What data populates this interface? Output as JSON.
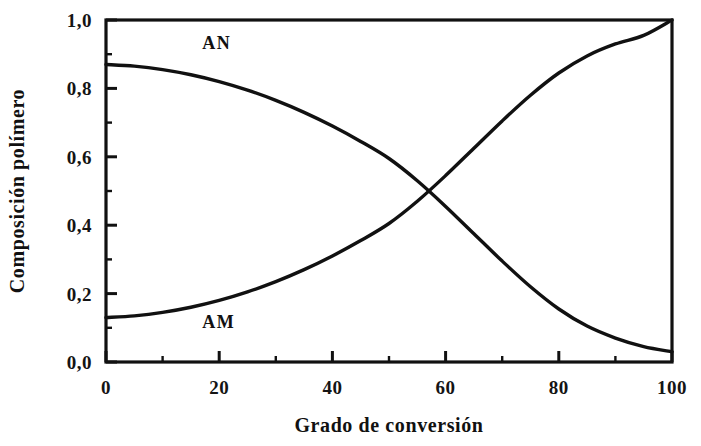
{
  "chart_data": {
    "type": "line",
    "title": "",
    "xlabel": "Grado de conversión",
    "ylabel": "Composición polímero",
    "xlim": [
      0,
      100
    ],
    "ylim": [
      0.0,
      1.0
    ],
    "grid": false,
    "legend": "inline-annotations",
    "x_ticks": [
      0,
      20,
      40,
      60,
      80,
      100
    ],
    "x_tick_labels": [
      "0",
      "20",
      "40",
      "60",
      "80",
      "100"
    ],
    "x_minor_step": 10,
    "y_ticks": [
      0.0,
      0.2,
      0.4,
      0.6,
      0.8,
      1.0
    ],
    "y_tick_labels": [
      "0,0",
      "0,2",
      "0,4",
      "0,6",
      "0,8",
      "1,0"
    ],
    "y_minor_step": 0.1,
    "x": [
      0,
      5,
      10,
      15,
      20,
      25,
      30,
      35,
      40,
      45,
      50,
      55,
      60,
      65,
      70,
      75,
      80,
      85,
      90,
      95,
      100
    ],
    "series": [
      {
        "name": "AN",
        "label": "AN",
        "color": "#111111",
        "values": [
          0.87,
          0.865,
          0.855,
          0.84,
          0.82,
          0.795,
          0.765,
          0.73,
          0.69,
          0.645,
          0.595,
          0.53,
          0.455,
          0.375,
          0.295,
          0.22,
          0.155,
          0.105,
          0.07,
          0.045,
          0.03
        ]
      },
      {
        "name": "AM",
        "label": "AM",
        "color": "#111111",
        "values": [
          0.13,
          0.135,
          0.145,
          0.16,
          0.18,
          0.205,
          0.235,
          0.27,
          0.31,
          0.355,
          0.405,
          0.47,
          0.545,
          0.625,
          0.705,
          0.78,
          0.845,
          0.895,
          0.93,
          0.955,
          1.0
        ]
      }
    ],
    "annotations": [
      {
        "text": "AN",
        "x": 17,
        "y": 0.915
      },
      {
        "text": "AM",
        "x": 17,
        "y": 0.1
      }
    ]
  }
}
